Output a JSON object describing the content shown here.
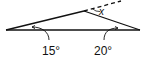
{
  "diagram": {
    "type": "triangle-exterior-angle",
    "labels": {
      "left_angle": "15°",
      "right_angle": "20°",
      "unknown_angle": "x"
    },
    "stroke_color": "#111111",
    "background": "#ffffff"
  }
}
